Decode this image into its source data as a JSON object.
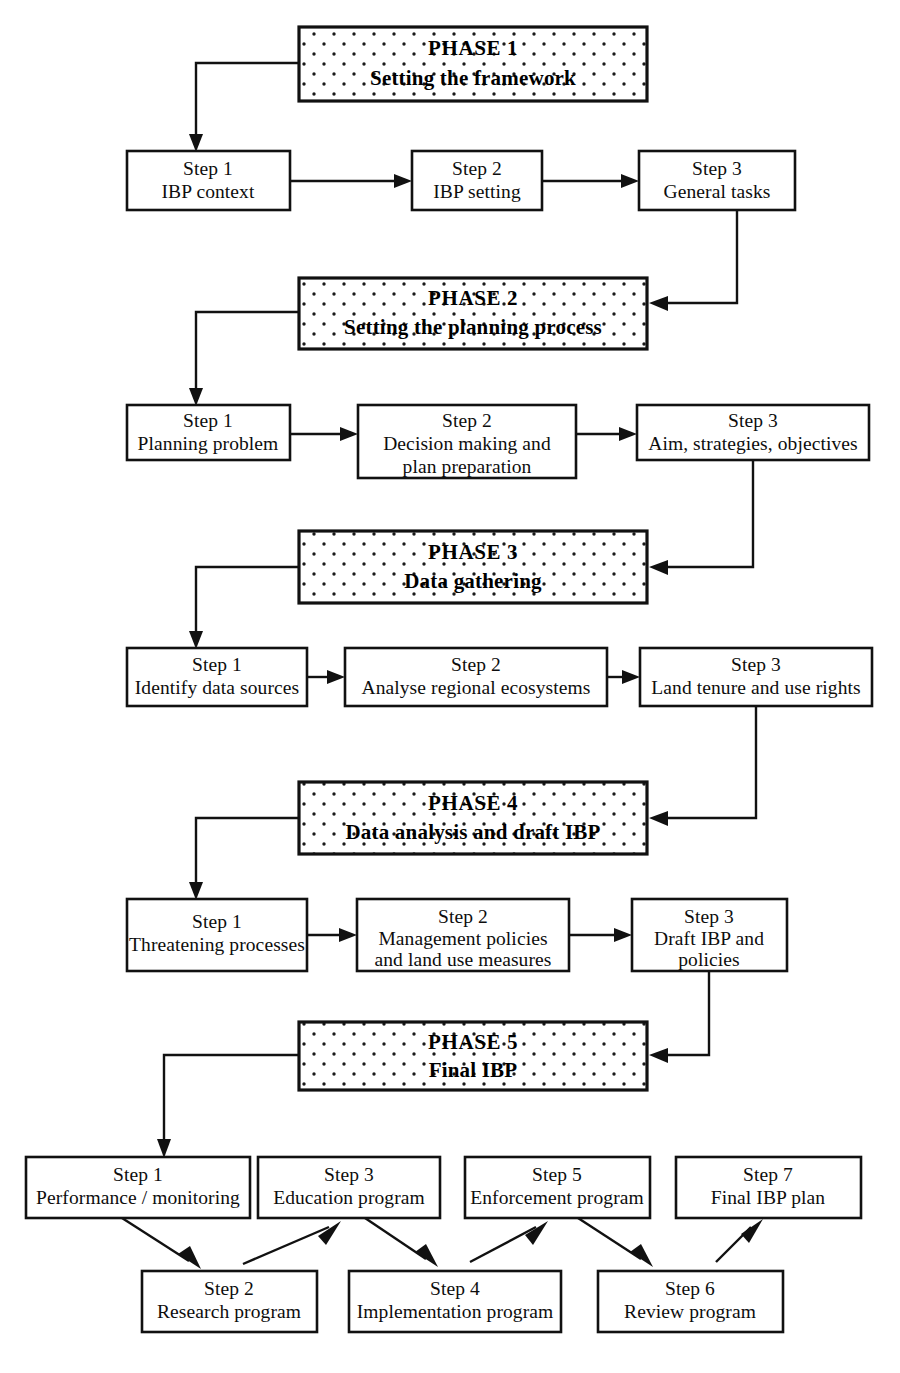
{
  "diagram": {
    "title_caption_fragment": "",
    "phases": [
      {
        "id": "phase-1",
        "title": "PHASE 1",
        "subtitle": "Setting the framework",
        "steps": [
          {
            "label": "Step 1",
            "text": "IBP context"
          },
          {
            "label": "Step 2",
            "text": "IBP setting"
          },
          {
            "label": "Step 3",
            "text": "General tasks"
          }
        ]
      },
      {
        "id": "phase-2",
        "title": "PHASE 2",
        "subtitle": "Setting the planning process",
        "steps": [
          {
            "label": "Step 1",
            "text": "Planning problem"
          },
          {
            "label": "Step 2",
            "text": "Decision making and",
            "text2": "plan preparation",
            "text3": "framework"
          },
          {
            "label": "Step 3",
            "text": "Aim, strategies, objectives"
          }
        ]
      },
      {
        "id": "phase-3",
        "title": "PHASE 3",
        "subtitle": "Data gathering",
        "steps": [
          {
            "label": "Step 1",
            "text": "Identify data sources"
          },
          {
            "label": "Step 2",
            "text": "Analyse regional ecosystems"
          },
          {
            "label": "Step 3",
            "text": "Land tenure and use rights"
          }
        ]
      },
      {
        "id": "phase-4",
        "title": "PHASE 4",
        "subtitle": "Data analysis and draft IBP",
        "steps": [
          {
            "label": "Step 1",
            "text": "Threatening processes"
          },
          {
            "label": "Step 2",
            "text": "Management policies",
            "text2": "and land use measures"
          },
          {
            "label": "Step 3",
            "text": "Draft IBP and",
            "text2": "policies"
          }
        ]
      },
      {
        "id": "phase-5",
        "title": "PHASE 5",
        "subtitle": "Final IBP",
        "steps": [
          {
            "label": "Step 1",
            "text": "Performance / monitoring"
          },
          {
            "label": "Step 2",
            "text": "Research program"
          },
          {
            "label": "Step 3",
            "text": "Education program"
          },
          {
            "label": "Step 4",
            "text": "Implementation program"
          },
          {
            "label": "Step 5",
            "text": "Enforcement program"
          },
          {
            "label": "Step 6",
            "text": "Review program"
          },
          {
            "label": "Step 7",
            "text": "Final IBP plan"
          }
        ]
      }
    ],
    "colors": {
      "line": "#111111",
      "box_fill": "#ffffff",
      "phase_fill_dots": "#1a1a1a",
      "text": "#0d0d0d"
    }
  }
}
